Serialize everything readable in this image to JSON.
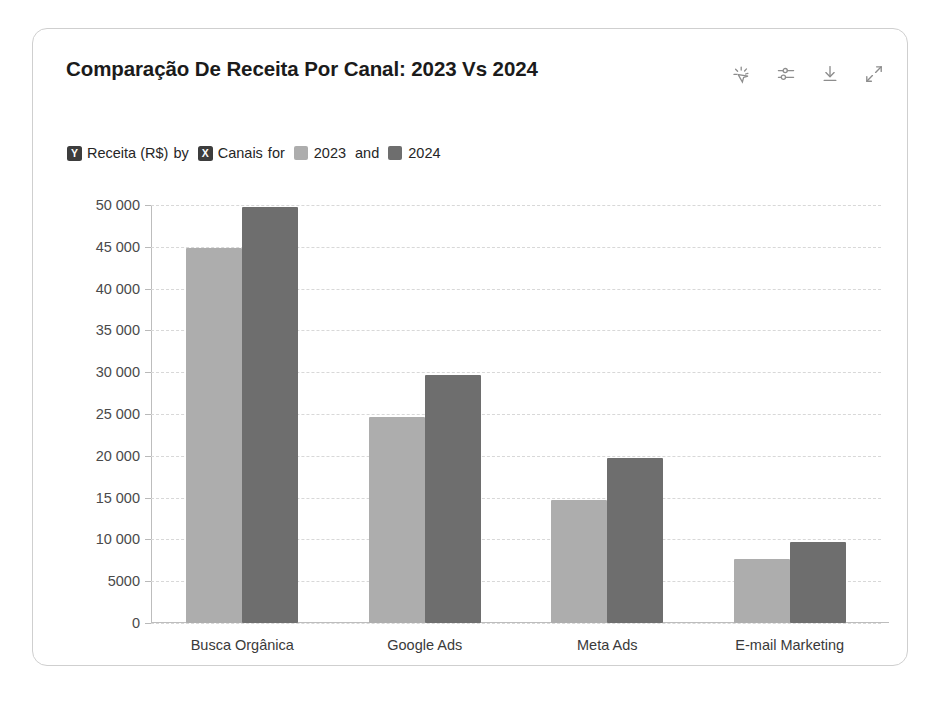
{
  "card": {
    "title": "Comparação De Receita Por Canal: 2023 Vs 2024"
  },
  "toolbar": {
    "items": [
      {
        "name": "ai-insights-icon",
        "label": "AI insights"
      },
      {
        "name": "filter-sliders-icon",
        "label": "Filters"
      },
      {
        "name": "download-icon",
        "label": "Download"
      },
      {
        "name": "expand-icon",
        "label": "Expand"
      }
    ]
  },
  "subtitle": {
    "y_badge": "Y",
    "y_measure": "Receita (R$)",
    "by_word": "by",
    "x_badge": "X",
    "x_dimension": "Canais",
    "for_word": "for",
    "series_a": "2023",
    "and_word": "and",
    "series_b": "2024"
  },
  "colors": {
    "series_2023": "#adadad",
    "series_2024": "#6e6e6e",
    "card_border": "#cfcfcf",
    "gridline": "#d8d8d8",
    "title_text": "#1b1b1b",
    "axis_text": "#4a4a4a",
    "badge_bg": "#3d3d3d"
  },
  "chart_data": {
    "type": "bar",
    "title": "Comparação De Receita Por Canal: 2023 Vs 2024",
    "xlabel": "Canais",
    "ylabel": "Receita (R$)",
    "categories": [
      "Busca Orgânica",
      "Google Ads",
      "Meta Ads",
      "E-mail Marketing"
    ],
    "series": [
      {
        "name": "2023",
        "color": "#adadad",
        "values": [
          44800,
          24700,
          14700,
          7700
        ]
      },
      {
        "name": "2024",
        "color": "#6e6e6e",
        "values": [
          49800,
          29700,
          19700,
          9700
        ]
      }
    ],
    "ylim": [
      0,
      50000
    ],
    "ytick_values": [
      0,
      5000,
      10000,
      15000,
      20000,
      25000,
      30000,
      35000,
      40000,
      45000,
      50000
    ],
    "ytick_labels": [
      "0",
      "5000",
      "10 000",
      "15 000",
      "20 000",
      "25 000",
      "30 000",
      "35 000",
      "40 000",
      "45 000",
      "50 000"
    ],
    "grid": true,
    "grid_style": "dashed-horizontal",
    "legend": "subtitle-inline",
    "bar_mode": "grouped"
  }
}
